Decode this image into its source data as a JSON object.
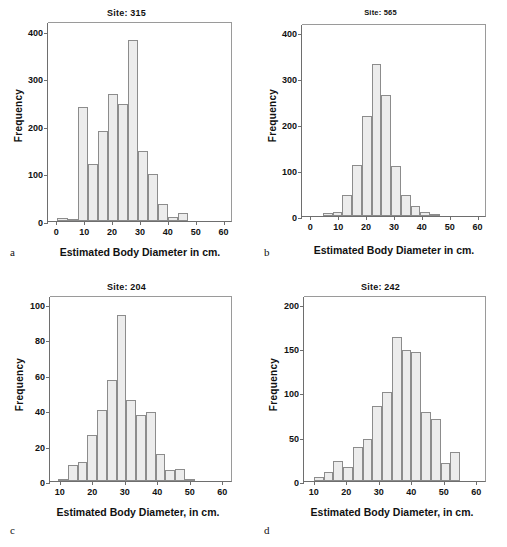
{
  "figure": {
    "panels": [
      {
        "letter": "a",
        "title": "Site: 315",
        "xlabel": "Estimated Body Diameter in cm.",
        "ylabel": "Frequency",
        "yticks": [
          0,
          100,
          200,
          300,
          400
        ],
        "xticks": [
          0,
          10,
          20,
          30,
          40,
          50,
          60
        ],
        "chart_data": {
          "type": "bar",
          "title": "Site: 315",
          "xlabel": "Estimated Body Diameter in cm.",
          "ylabel": "Frequency",
          "xlim": [
            -3,
            63
          ],
          "ylim": [
            0,
            420
          ],
          "grid": false,
          "legend": "none",
          "bin_width": 3.6,
          "bin_starts": [
            0.4,
            4.0,
            7.6,
            11.2,
            14.8,
            18.4,
            22.0,
            25.6,
            29.2,
            32.8,
            36.4,
            40.0,
            43.6,
            47.2
          ],
          "categories": [
            "0.4-4",
            "4-7.6",
            "7.6-11.2",
            "11.2-14.8",
            "14.8-18.4",
            "18.4-22",
            "22-25.6",
            "25.6-29.2",
            "29.2-32.8",
            "32.8-36.4",
            "36.4-40",
            "40-43.6",
            "43.6-47.2",
            "47.2-50.8"
          ],
          "values": [
            6,
            2,
            239,
            120,
            190,
            267,
            245,
            380,
            148,
            99,
            35,
            9,
            16,
            0
          ]
        }
      },
      {
        "letter": "b",
        "title": "Site: 565",
        "xlabel": "Estimated Body Diameter in cm.",
        "ylabel": "Frequency",
        "yticks": [
          0,
          100,
          200,
          300,
          400
        ],
        "xticks": [
          0,
          10,
          20,
          30,
          40,
          50,
          60
        ],
        "chart_data": {
          "type": "bar",
          "title": "Site: 565",
          "xlabel": "Estimated Body Diameter in cm.",
          "ylabel": "Frequency",
          "xlim": [
            -3,
            63
          ],
          "ylim": [
            0,
            420
          ],
          "grid": false,
          "legend": "none",
          "bin_width": 3.5,
          "bin_starts": [
            4.5,
            8.0,
            11.5,
            15.0,
            18.5,
            22.0,
            25.5,
            29.0,
            32.5,
            36.0,
            39.5,
            43.0,
            46.5,
            50.0
          ],
          "categories": [
            "4.5-8",
            "8-11.5",
            "11.5-15",
            "15-18.5",
            "18.5-22",
            "22-25.5",
            "25.5-29",
            "29-32.5",
            "32.5-36",
            "36-39.5",
            "39.5-43",
            "43-46.5",
            "46.5-50",
            "50-53.5"
          ],
          "values": [
            6,
            9,
            45,
            112,
            218,
            331,
            264,
            108,
            45,
            21,
            8,
            5,
            0,
            0
          ]
        }
      },
      {
        "letter": "c",
        "title": "Site: 204",
        "xlabel": "Estimated Body Diameter, in cm.",
        "ylabel": "Frequency",
        "yticks": [
          0,
          20,
          40,
          60,
          80,
          100
        ],
        "xticks": [
          10,
          20,
          30,
          40,
          50,
          60
        ],
        "chart_data": {
          "type": "bar",
          "title": "Site: 204",
          "xlabel": "Estimated Body Diameter, in cm.",
          "ylabel": "Frequency",
          "xlim": [
            7,
            63
          ],
          "ylim": [
            0,
            105
          ],
          "grid": false,
          "legend": "none",
          "bin_width": 3.0,
          "bin_starts": [
            9.5,
            12.5,
            15.5,
            18.5,
            21.5,
            24.5,
            27.5,
            30.5,
            33.5,
            36.5,
            39.5,
            42.5,
            45.5,
            48.5,
            51.5,
            54.5
          ],
          "categories": [
            "9.5-12.5",
            "12.5-15.5",
            "15.5-18.5",
            "18.5-21.5",
            "21.5-24.5",
            "24.5-27.5",
            "27.5-30.5",
            "30.5-33.5",
            "33.5-36.5",
            "36.5-39.5",
            "39.5-42.5",
            "42.5-45.5",
            "45.5-48.5",
            "48.5-51.5",
            "51.5-54.5",
            "54.5-57.5"
          ],
          "values": [
            1,
            9,
            11,
            26,
            40,
            57,
            94,
            46,
            37,
            39,
            15,
            6,
            7,
            1,
            0,
            0
          ]
        }
      },
      {
        "letter": "d",
        "title": "Site: 242",
        "xlabel": "Estimated Body Diameter, in cm.",
        "ylabel": "Frequency",
        "yticks": [
          0,
          50,
          100,
          150,
          200
        ],
        "xticks": [
          10,
          20,
          30,
          40,
          50,
          60
        ],
        "chart_data": {
          "type": "bar",
          "title": "Site: 242",
          "xlabel": "Estimated Body Diameter, in cm.",
          "ylabel": "Frequency",
          "xlim": [
            7,
            63
          ],
          "ylim": [
            0,
            210
          ],
          "grid": false,
          "legend": "none",
          "bin_width": 3.0,
          "bin_starts": [
            10.0,
            13.0,
            16.0,
            19.0,
            22.0,
            25.0,
            28.0,
            31.0,
            34.0,
            37.0,
            40.0,
            43.0,
            46.0,
            49.0,
            52.0
          ],
          "categories": [
            "10-13",
            "13-16",
            "16-19",
            "19-22",
            "22-25",
            "25-28",
            "28-31",
            "31-34",
            "34-37",
            "37-40",
            "40-43",
            "43-46",
            "46-49",
            "49-52",
            "52-55"
          ],
          "values": [
            4,
            10,
            23,
            16,
            38,
            48,
            85,
            101,
            163,
            148,
            146,
            78,
            70,
            20,
            33
          ]
        }
      }
    ]
  }
}
